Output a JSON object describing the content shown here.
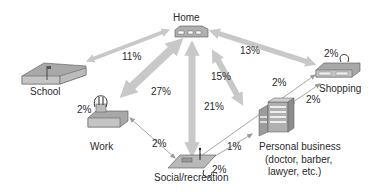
{
  "diagram": {
    "nodes": {
      "home": {
        "label": "Home"
      },
      "school": {
        "label": "School"
      },
      "work": {
        "label": "Work",
        "self_loop": "2%"
      },
      "shopping": {
        "label": "Shopping",
        "self_loop": "2%"
      },
      "social": {
        "label": "Social/recreation",
        "self_loop": "2%"
      },
      "personal": {
        "label_line1": "Personal business",
        "label_line2": "(doctor, barber,",
        "label_line3": "lawyer, etc.)"
      }
    },
    "edges": {
      "home_school": "11%",
      "home_work": "27%",
      "home_social": "21%",
      "home_personal": "15%",
      "home_shopping": "13%",
      "work_social": "2%",
      "social_shopping": "2%",
      "shopping_personal": "2%",
      "social_personal": "1%"
    },
    "colors": {
      "arrow": "#c8c8c8",
      "thin_arrow": "#a8a8a8",
      "icon": "#8c8c8c",
      "text": "#2a2a2a"
    }
  }
}
